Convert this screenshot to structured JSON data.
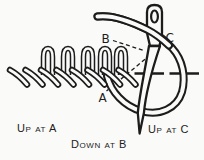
{
  "diagram": {
    "figure": "blanket-stitch-embroidery-diagram",
    "point_labels": {
      "a": "A",
      "b": "B",
      "c": "C"
    },
    "captions": {
      "up_a": "Up at A",
      "down_b": "Down at B",
      "up_c": "Up at C"
    },
    "colors": {
      "ink": "#1c1c1c",
      "paper": "#fafaf8"
    }
  }
}
